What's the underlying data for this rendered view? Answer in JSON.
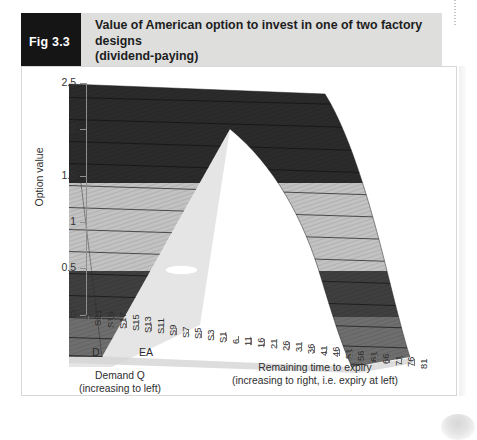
{
  "caption": {
    "tag": "Fig 3.3",
    "line1": "Value of American option to invest in one of two factory designs",
    "line2": "(dividend-paying)"
  },
  "chart_data": {
    "type": "surface",
    "title": "Value of American option to invest in one of two factory designs (dividend-paying)",
    "ylabel": "Option value",
    "xlabel_right": "Remaining time to expiry",
    "xlabel_right_sub": "(increasing to right, i.e. expiry at left)",
    "xlabel_left": "Demand Q",
    "xlabel_left_sub": "(increasing to left)",
    "ylim": [
      0,
      2.5
    ],
    "y_ticks": [
      "0",
      "0.5",
      "1",
      "1.5",
      "2",
      "2.5"
    ],
    "y_tick_values": [
      0,
      0.5,
      1,
      1.5,
      2,
      2.5
    ],
    "grid": false,
    "legend": "none",
    "point_labels": [
      {
        "label": "D",
        "sub": ""
      },
      {
        "label": "E",
        "sub": "A"
      }
    ],
    "x_ticks": [
      "S21",
      "S19",
      "S17",
      "S15",
      "S13",
      "S11",
      "S9",
      "S7",
      "S5",
      "S3",
      "S1",
      "6",
      "11",
      "16",
      "21",
      "26",
      "31",
      "36",
      "41",
      "46",
      "51",
      "56",
      "61",
      "66",
      "71",
      "76",
      "81"
    ],
    "band_breaks": [
      0,
      0.5,
      1.0,
      1.5,
      2.0,
      2.5
    ],
    "band_colors": [
      "#8c8c8c",
      "#4a4a4a",
      "#bfbfbf",
      "#bfbfbf",
      "#2b2b2b"
    ],
    "series_note": "Surface falls from ~2.5 at far-left/far-back to ~0 at the right (expiry) edge; ridge runs diagonally across the demand axis.",
    "back_edge_values": [
      2.5,
      2.42,
      2.3,
      2.18,
      2.02,
      1.86,
      1.7,
      1.52,
      1.34,
      1.16,
      1.0,
      0.86,
      0.72,
      0.6,
      0.48,
      0.38,
      0.29,
      0.21,
      0.15,
      0.1,
      0.06,
      0.03,
      0.01,
      0.0
    ],
    "front_edge_values": [
      2.5,
      2.38,
      2.24,
      2.1,
      1.94,
      1.76,
      1.58,
      1.4,
      1.22,
      1.04,
      0.88,
      0.72,
      0.58,
      0.46,
      0.35,
      0.26,
      0.18,
      0.12,
      0.07,
      0.04,
      0.02,
      0.01,
      0.0,
      0.0
    ]
  },
  "colors": {
    "caption_tag_bg": "#151515",
    "caption_bar_bg": "#dededd",
    "frame_border": "#d7d7d7",
    "axis": "#8f8f8f",
    "floor": "#cfcfcf",
    "band_dark": "#2b2b2b",
    "band_light": "#bfbfbf",
    "band_mid": "#4a4a4a",
    "band_base": "#8c8c8c"
  }
}
